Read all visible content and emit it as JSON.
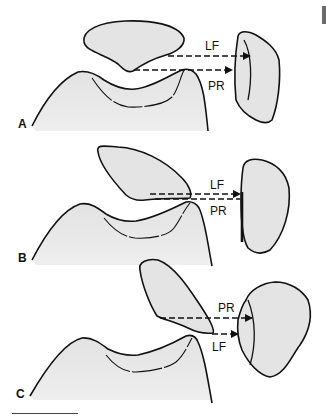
{
  "figure": {
    "panels": [
      {
        "id": "A",
        "label": "A",
        "upper_arrow_label": "LF",
        "lower_arrow_label": "PR"
      },
      {
        "id": "B",
        "label": "B",
        "upper_arrow_label": "LF",
        "lower_arrow_label": "PR"
      },
      {
        "id": "C",
        "label": "C",
        "upper_arrow_label": "PR",
        "lower_arrow_label": "LF"
      }
    ],
    "colors": {
      "outline": "#111111",
      "fill": "#e6e6e6",
      "background": "#ffffff"
    }
  }
}
